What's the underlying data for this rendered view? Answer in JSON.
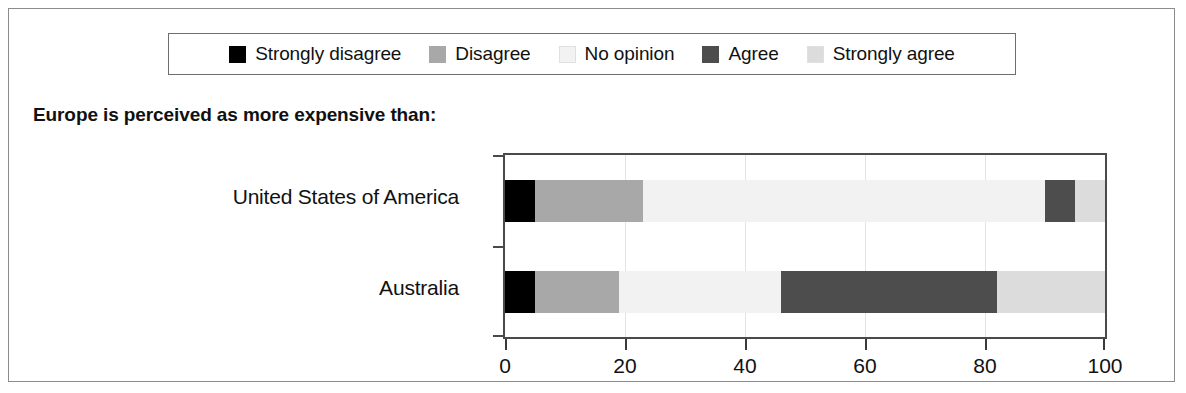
{
  "chart_data": {
    "type": "bar",
    "orientation": "horizontal",
    "stacked": true,
    "title": "Europe is perceived as more expensive than:",
    "xlabel": "",
    "ylabel": "",
    "xlim": [
      0,
      100
    ],
    "xticks": [
      0,
      20,
      40,
      60,
      80,
      100
    ],
    "xtick_labels": [
      "0",
      "20",
      "40",
      "60",
      "80",
      "100"
    ],
    "grid": true,
    "legend_position": "top",
    "categories": [
      "United States of America",
      "Australia"
    ],
    "series": [
      {
        "name": "Strongly disagree",
        "color": "#000000",
        "values": [
          5,
          5
        ]
      },
      {
        "name": "Disagree",
        "color": "#a8a8a8",
        "values": [
          18,
          14
        ]
      },
      {
        "name": "No opinion",
        "color": "#f2f2f2",
        "values": [
          67,
          27
        ]
      },
      {
        "name": "Agree",
        "color": "#4d4d4d",
        "values": [
          5,
          36
        ]
      },
      {
        "name": "Strongly agree",
        "color": "#dcdcdc",
        "values": [
          5,
          18
        ]
      }
    ]
  },
  "legend": {
    "items": [
      {
        "label": "Strongly disagree",
        "color": "#000000"
      },
      {
        "label": "Disagree",
        "color": "#a8a8a8"
      },
      {
        "label": "No opinion",
        "color": "#f2f2f2"
      },
      {
        "label": "Agree",
        "color": "#4d4d4d"
      },
      {
        "label": "Strongly agree",
        "color": "#dcdcdc"
      }
    ]
  }
}
